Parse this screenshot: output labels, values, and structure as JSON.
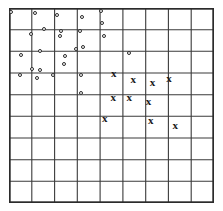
{
  "figure": {
    "title": "",
    "background_color": "#ffffff",
    "grid_line_color": "#3a3a3a",
    "border_color": "#2b2b2b",
    "circle_marker_color": "#2b2b2b",
    "cross_marker_color": "#1a1a1a",
    "cross_glyph": "x"
  },
  "chart_data": {
    "type": "scatter",
    "title": "",
    "xlabel": "",
    "ylabel": "",
    "xlim": [
      0,
      9
    ],
    "ylim": [
      0,
      9
    ],
    "grid": true,
    "grid_rows": 9,
    "grid_cols": 9,
    "legend": "none",
    "tick_labels_x": [],
    "tick_labels_y": [],
    "series": [
      {
        "name": "circle-class",
        "marker": "o",
        "count": 28,
        "points": [
          [
            0.08,
            8.82
          ],
          [
            1.15,
            8.78
          ],
          [
            2.12,
            8.7
          ],
          [
            3.2,
            8.6
          ],
          [
            4.02,
            8.85
          ],
          [
            4.08,
            8.3
          ],
          [
            0.95,
            7.78
          ],
          [
            1.52,
            8.05
          ],
          [
            2.3,
            7.95
          ],
          [
            2.22,
            7.7
          ],
          [
            3.1,
            7.92
          ],
          [
            4.18,
            7.72
          ],
          [
            0.52,
            6.85
          ],
          [
            1.38,
            7.0
          ],
          [
            2.48,
            6.78
          ],
          [
            2.95,
            7.12
          ],
          [
            3.25,
            7.2
          ],
          [
            5.25,
            6.92
          ],
          [
            2.4,
            6.42
          ],
          [
            0.5,
            5.9
          ],
          [
            1.02,
            6.18
          ],
          [
            1.35,
            6.15
          ],
          [
            1.22,
            5.78
          ],
          [
            1.95,
            5.92
          ],
          [
            3.15,
            5.92
          ],
          [
            3.18,
            5.08
          ]
        ]
      },
      {
        "name": "cross-class",
        "marker": "x",
        "count": 11,
        "points": [
          [
            4.6,
            5.98
          ],
          [
            5.45,
            5.72
          ],
          [
            6.3,
            5.58
          ],
          [
            7.02,
            5.78
          ],
          [
            4.58,
            4.9
          ],
          [
            5.28,
            4.9
          ],
          [
            6.12,
            4.7
          ],
          [
            4.2,
            3.92
          ],
          [
            6.22,
            3.85
          ],
          [
            7.3,
            3.58
          ]
        ]
      }
    ]
  }
}
